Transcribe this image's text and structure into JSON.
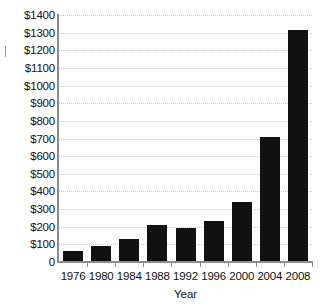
{
  "chart_data": {
    "type": "bar",
    "title": "",
    "subtitle": "",
    "xlabel": "Year",
    "ylabel": "",
    "categories": [
      "1976",
      "1980",
      "1984",
      "1988",
      "1992",
      "1996",
      "2000",
      "2004",
      "2008"
    ],
    "values": [
      65,
      90,
      130,
      210,
      190,
      235,
      340,
      710,
      1315
    ],
    "value_prefix": "$",
    "ylim": [
      0,
      1400
    ],
    "ytick_values": [
      0,
      100,
      200,
      300,
      400,
      500,
      600,
      700,
      800,
      900,
      1000,
      1100,
      1200,
      1300,
      1400
    ],
    "ytick_labels": [
      "0",
      "$100",
      "$200",
      "$300",
      "$400",
      "$500",
      "$600",
      "$700",
      "$800",
      "$900",
      "$1000",
      "$1100",
      "$1200",
      "$1300",
      "$1400"
    ],
    "grid": true,
    "grid_axis": "y",
    "grid_style": "dotted",
    "legend": false,
    "legend_position": "none",
    "bar_color": "#111111",
    "grid_color": "#c9c9c9",
    "axis_color": "#8c8c8c",
    "background_color": "#ffffff",
    "text_color": "#111111"
  }
}
